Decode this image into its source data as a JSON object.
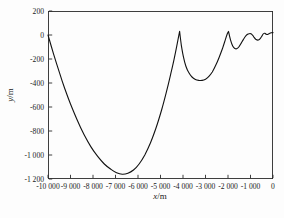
{
  "chart_data": {
    "type": "line",
    "title": "",
    "xlabel": "x/m",
    "xlabel_var": "x",
    "xlabel_unit": "/m",
    "ylabel": "y/m",
    "ylabel_var": "y",
    "ylabel_unit": "/m",
    "xlim": [
      -10000,
      0
    ],
    "ylim": [
      -1200,
      200
    ],
    "grid": false,
    "legend": "none",
    "line_color": "#111111",
    "frame_color": "#2a2a2a",
    "x_ticks": [
      -10000,
      -9000,
      -8000,
      -7000,
      -6000,
      -5000,
      -4000,
      -3000,
      -2000,
      -1000,
      0
    ],
    "x_tick_labels": [
      "-10 000",
      "-9 000",
      "-8 000",
      "-7 000",
      "-6 000",
      "-5 000",
      "-4 000",
      "-3 000",
      "-2 000",
      "-1 000",
      "0"
    ],
    "y_ticks": [
      200,
      0,
      -200,
      -400,
      -600,
      -800,
      -1000,
      -1200
    ],
    "y_tick_labels": [
      "200",
      "0",
      "-200",
      "-400",
      "-600",
      "-800",
      "-1 000",
      "-1 200"
    ],
    "series": [
      {
        "segments": [
          [
            [
              -10000,
              0
            ],
            [
              -9750,
              -160
            ],
            [
              -9500,
              -310
            ],
            [
              -9250,
              -450
            ],
            [
              -9000,
              -575
            ],
            [
              -8700,
              -710
            ],
            [
              -8400,
              -830
            ],
            [
              -8100,
              -930
            ],
            [
              -7800,
              -1010
            ],
            [
              -7500,
              -1075
            ],
            [
              -7200,
              -1120
            ],
            [
              -6950,
              -1148
            ],
            [
              -6700,
              -1160
            ],
            [
              -6450,
              -1152
            ],
            [
              -6200,
              -1125
            ],
            [
              -5950,
              -1075
            ],
            [
              -5700,
              -1000
            ],
            [
              -5450,
              -900
            ],
            [
              -5200,
              -775
            ],
            [
              -4950,
              -625
            ],
            [
              -4750,
              -485
            ],
            [
              -4550,
              -330
            ],
            [
              -4400,
              -205
            ],
            [
              -4280,
              -95
            ],
            [
              -4150,
              30
            ]
          ],
          [
            [
              -4150,
              30
            ],
            [
              -4070,
              -90
            ],
            [
              -3980,
              -185
            ],
            [
              -3870,
              -260
            ],
            [
              -3740,
              -315
            ],
            [
              -3600,
              -350
            ],
            [
              -3450,
              -370
            ],
            [
              -3300,
              -378
            ],
            [
              -3150,
              -378
            ],
            [
              -3000,
              -368
            ],
            [
              -2850,
              -345
            ],
            [
              -2700,
              -308
            ],
            [
              -2550,
              -255
            ],
            [
              -2400,
              -190
            ],
            [
              -2250,
              -115
            ],
            [
              -2120,
              -40
            ],
            [
              -2030,
              10
            ],
            [
              -1980,
              30
            ]
          ],
          [
            [
              -1980,
              30
            ],
            [
              -1890,
              -40
            ],
            [
              -1790,
              -92
            ],
            [
              -1700,
              -112
            ],
            [
              -1620,
              -115
            ],
            [
              -1520,
              -100
            ],
            [
              -1420,
              -70
            ],
            [
              -1320,
              -38
            ],
            [
              -1200,
              -5
            ],
            [
              -1100,
              8
            ],
            [
              -1000,
              12
            ],
            [
              -920,
              2
            ],
            [
              -840,
              -20
            ],
            [
              -750,
              -38
            ],
            [
              -650,
              -42
            ],
            [
              -560,
              -28
            ],
            [
              -480,
              -5
            ],
            [
              -420,
              12
            ],
            [
              -360,
              14
            ],
            [
              -300,
              6
            ],
            [
              -240,
              4
            ],
            [
              -160,
              12
            ],
            [
              -80,
              18
            ],
            [
              0,
              20
            ]
          ]
        ]
      }
    ]
  }
}
